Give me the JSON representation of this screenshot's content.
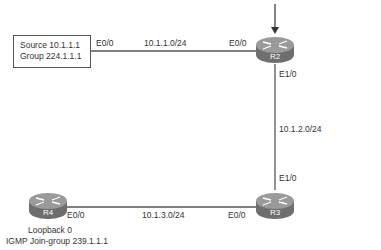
{
  "diagram": {
    "type": "network-topology",
    "source_box": {
      "line1": "Source 10.1.1.1",
      "line2": "Group 224.1.1.1"
    },
    "routers": [
      {
        "id": "R2",
        "label": "R2"
      },
      {
        "id": "R3",
        "label": "R3"
      },
      {
        "id": "R4",
        "label": "R4"
      }
    ],
    "links": [
      {
        "from": "source",
        "to": "R2",
        "subnet": "10.1.1.0/24",
        "from_intf": "E0/0",
        "to_intf": "E0/0"
      },
      {
        "from": "R2",
        "to": "R3",
        "subnet": "10.1.2.0/24",
        "from_intf": "E1/0",
        "to_intf": "E1/0"
      },
      {
        "from": "R4",
        "to": "R3",
        "subnet": "10.1.3.0/24",
        "from_intf": "E0/0",
        "to_intf": "E0/0"
      }
    ],
    "r4_notes": {
      "line1": "Loopback 0",
      "line2": "IGMP Join-group 239.1.1.1"
    },
    "colors": {
      "router_body": "#7a7a7a",
      "router_top": "#9a9a9a",
      "line": "#555555",
      "text": "#333333"
    }
  }
}
